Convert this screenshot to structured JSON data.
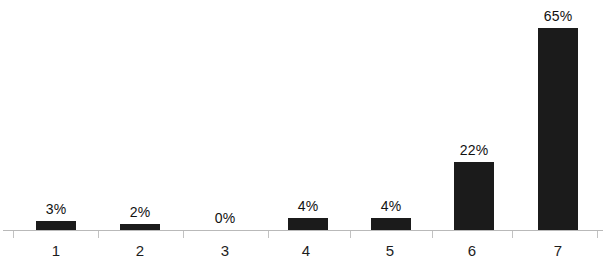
{
  "chart_data": {
    "type": "bar",
    "title": "",
    "subtitle": "",
    "xlabel": "",
    "ylabel": "",
    "categories": [
      "1",
      "2",
      "3",
      "4",
      "5",
      "6",
      "7"
    ],
    "values": [
      3,
      2,
      0,
      4,
      4,
      22,
      65
    ],
    "value_labels": [
      "3%",
      "2%",
      "0%",
      "4%",
      "4%",
      "22%",
      "65%"
    ],
    "ylim": [
      0,
      65
    ],
    "grid": false,
    "legend": null,
    "units": "percent",
    "bar_color": "#1b1b1b",
    "axis_color": "#b9b9b9",
    "background_color": "#ffffff",
    "annotations": []
  },
  "axis": {
    "ticks": [
      "",
      "",
      "",
      "",
      "",
      "",
      "",
      ""
    ]
  }
}
